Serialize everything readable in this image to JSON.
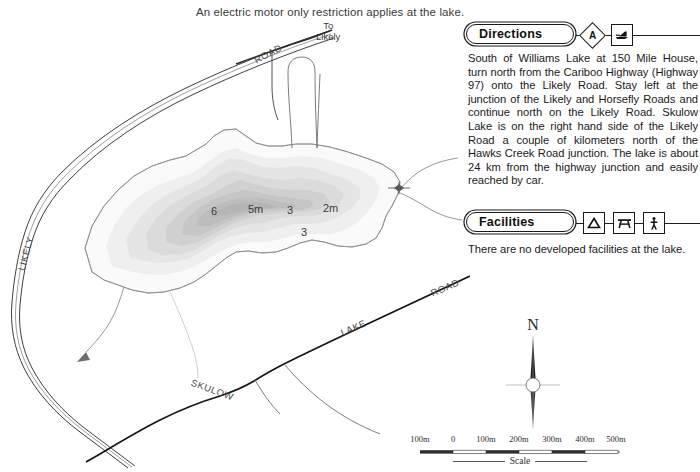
{
  "headline": "An electric motor only restriction applies at the lake.",
  "map": {
    "name": "skulow-lake-bathymetric-map",
    "labels": [
      {
        "id": "road-top",
        "text": "ROAD",
        "x": 253,
        "y": 29,
        "rot": -27
      },
      {
        "id": "likely-road",
        "text": "LIKELY",
        "x": 16,
        "y": 248,
        "rot": -75
      },
      {
        "id": "skulow",
        "text": "SKULOW",
        "x": 196,
        "y": 382,
        "rot": 20
      },
      {
        "id": "lake",
        "text": "LAKE",
        "x": 345,
        "y": 323,
        "rot": -23
      },
      {
        "id": "road-bottom",
        "text": "ROAD",
        "x": 434,
        "y": 283,
        "rot": -23
      }
    ],
    "to_likely": {
      "line1": "To",
      "line2": "Likely",
      "x": 326,
      "y": 20
    },
    "depths": [
      {
        "value": "6",
        "x": 211,
        "y": 205
      },
      {
        "value": "5m",
        "x": 249,
        "y": 203
      },
      {
        "value": "3",
        "x": 287,
        "y": 204
      },
      {
        "value": "2m",
        "x": 325,
        "y": 202
      },
      {
        "value": "3",
        "x": 302,
        "y": 226
      }
    ]
  },
  "directions": {
    "title": "Directions",
    "badge": "A",
    "icons": [
      "boat-launch-icon"
    ],
    "text": "South of Williams Lake at 150 Mile House, turn north from the Cariboo Highway (Highway 97) onto the Likely Road. Stay left at the junction of the Likely and Horsefly Roads and continue north on the Likely Road. Skulow Lake is on the right hand side of the Likely Road a couple of kilometers north of the Hawks Creek Road junction. The lake is about 24 km from the highway junction and easily reached by car."
  },
  "facilities": {
    "title": "Facilities",
    "icons": [
      "tent-icon",
      "picnic-table-icon",
      "toilet-icon"
    ],
    "text": "There are no developed facilities at the lake."
  },
  "compass": {
    "north_label": "N"
  },
  "scale": {
    "label": "Scale",
    "ticks": [
      {
        "text": "100m",
        "pos": 0
      },
      {
        "text": "0",
        "pos": 33
      },
      {
        "text": "100m",
        "pos": 66
      },
      {
        "text": "200m",
        "pos": 99
      },
      {
        "text": "300m",
        "pos": 132
      },
      {
        "text": "400m",
        "pos": 165
      },
      {
        "text": "500m",
        "pos": 198
      }
    ]
  },
  "colors": {
    "ink": "#1b1818",
    "road": "#2a2727",
    "shore": "#8d8d8d",
    "depth1": "#f2f2f2",
    "depth2": "#e6e6e6",
    "depth3": "#dcdcdc",
    "depth4": "#d0d0d0",
    "depth5": "#c3c3c3",
    "depth6": "#b9b9b9"
  }
}
